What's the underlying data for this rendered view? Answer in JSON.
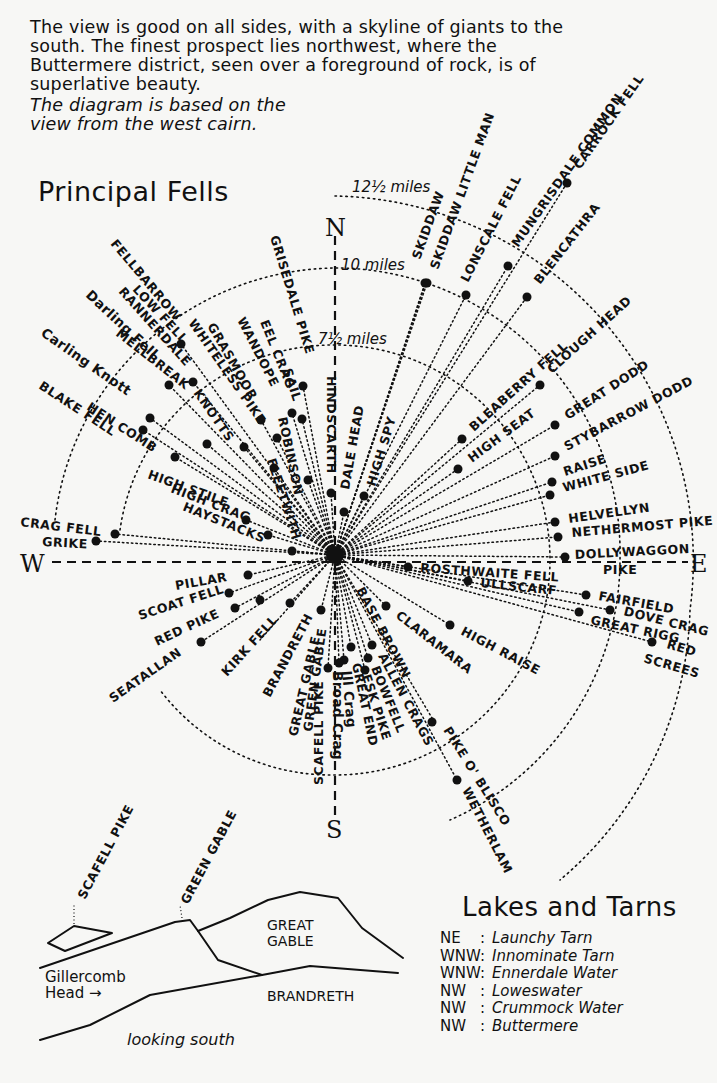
{
  "intro": {
    "paragraph": "The view is good on all sides, with a skyline of giants to the south. The finest prospect lies northwest, where the Buttermere district, seen over a foreground of rock, is of superlative beauty.",
    "note_line1": "The diagram is based on the",
    "note_line2": "view from the west cairn."
  },
  "principal_fells": {
    "title": "Principal Fells",
    "compass": {
      "north": "N",
      "south": "S",
      "east": "E",
      "west": "W"
    },
    "distance_rings": [
      {
        "label": "7½ miles",
        "miles": 7.5
      },
      {
        "label": "10 miles",
        "miles": 10
      },
      {
        "label": "12½ miles",
        "miles": 12.5
      }
    ],
    "labels": {
      "skiddaw": "SKIDDAW",
      "skiddaw_little_man": "SKIDDAW LITTLE MAN",
      "lonscale_fell": "LONSCALE FELL",
      "mungrisdale_common": "MUNGRISDALE COMMON",
      "carrock_fell": "CARROCK FELL",
      "blencathra": "BLENCATHRA",
      "clough_head": "CLOUGH HEAD",
      "bleaberry_fell": "BLEABERRY FELL",
      "high_seat": "HIGH SEAT",
      "great_dodd": "GREAT DODD",
      "stybarrow_dodd": "STYBARROW DODD",
      "raise": "RAISE",
      "white_side": "WHITE SIDE",
      "helvellyn": "HELVELLYN",
      "nethermost_pike": "NETHERMOST PIKE",
      "dollywaggon_pike_1": "DOLLYWAGGON",
      "dollywaggon_pike_2": "PIKE",
      "rosthwaite_fell": "ROSTHWAITE FELL",
      "ullscarf": "ULLSCARF",
      "fairfield": "FAIRFIELD",
      "dove_crag": "DOVE CRAG",
      "great_rigg": "GREAT RIGG",
      "red_screes_1": "RED",
      "red_screes_2": "SCREES",
      "high_raise": "HIGH RAISE",
      "claramara": "CLARAMARA",
      "base_brown": "BASE BROWN",
      "allen_crags": "ALLEN CRAGS",
      "bowfell": "BOWFELL",
      "esk_pike": "ESK PIKE",
      "great_end": "GREAT END",
      "ill_crag": "Ill Crag",
      "broad_crag": "Broad Crag",
      "scafell_pike": "SCAFELL PIKE",
      "pike_o_blisco": "PIKE O' BLISCO",
      "wetherlam": "WETHERLAM",
      "green_gable": "GREEN GABLE",
      "great_gable": "GREAT GABLE",
      "brandreth": "BRANDRETH",
      "kirk_fell": "KIRK FELL",
      "seatallan": "SEATALLAN",
      "red_pike": "RED PIKE",
      "scoat_fell": "SCOAT FELL",
      "pillar": "PILLAR",
      "crag_fell": "CRAG FELL",
      "grike": "GRIKE",
      "high_stile": "HIGH STILE",
      "high_crag": "HIGH CRAG",
      "haystacks": "HAYSTACKS",
      "hen_comb": "HEN COMB",
      "blake_fell": "BLAKE FELL",
      "carling_knott": "Carling Knott",
      "mellbreak": "MELLBREAK",
      "darling_fell": "Darling Fell",
      "rannerdale_knotts": "RANNERDALE",
      "knotts": "KNOTTS",
      "low_fell": "LOW FELL",
      "fellbarrow": "FELLBARROW",
      "whiteless_pike": "WHITELESS PIKE",
      "grasmoor": "GRASMOOR",
      "wandope": "WANDOPE",
      "eel_crag": "EEL CRAG",
      "sail": "SAIL",
      "grisedale_pike": "GRISEDALE PIKE",
      "robinson": "ROBINSON",
      "fleetwith": "FLEETWITH",
      "hindscarth": "HINDSCARTH",
      "dale_head": "DALE HEAD",
      "high_spy": "HIGH SPY"
    }
  },
  "sketch": {
    "peak_labels": {
      "scafell_pike": "SCAFELL PIKE",
      "green_gable": "GREEN GABLE"
    },
    "great_gable_1": "GREAT",
    "great_gable_2": "GABLE",
    "brandreth": "BRANDRETH",
    "gillercomb_1": "Gillercomb",
    "gillercomb_2": "Head →",
    "caption": "looking south"
  },
  "lakes_and_tarns": {
    "title": "Lakes and Tarns",
    "items": [
      {
        "direction": "NE",
        "name": "Launchy Tarn"
      },
      {
        "direction": "WNW",
        "name": "Innominate Tarn"
      },
      {
        "direction": "WNW",
        "name": "Ennerdale Water"
      },
      {
        "direction": "NW",
        "name": "Loweswater"
      },
      {
        "direction": "NW",
        "name": "Crummock Water"
      },
      {
        "direction": "NW",
        "name": "Buttermere"
      }
    ]
  }
}
